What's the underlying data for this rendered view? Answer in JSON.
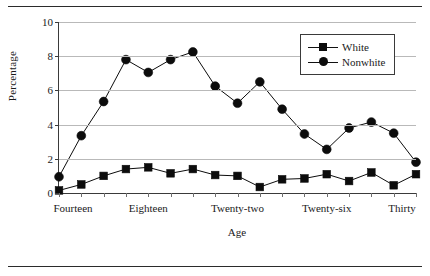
{
  "chart_data": {
    "type": "line",
    "title": "",
    "xlabel": "Age",
    "ylabel": "Percentage",
    "ylim": [
      0,
      10
    ],
    "yticks": [
      0,
      2,
      4,
      6,
      8,
      10
    ],
    "ytick_labels": [
      "0",
      "2",
      "4",
      "6",
      "8",
      "10"
    ],
    "grid": "horizontal",
    "legend_position": "top-right",
    "x": [
      14,
      15,
      16,
      17,
      18,
      19,
      20,
      21,
      22,
      23,
      24,
      25,
      26,
      27,
      28,
      29,
      30
    ],
    "categories": [
      "Fourteen",
      "Fifteen",
      "Sixteen",
      "Seventeen",
      "Eighteen",
      "Nineteen",
      "Twenty",
      "Twenty-one",
      "Twenty-two",
      "Twenty-three",
      "Twenty-four",
      "Twenty-five",
      "Twenty-six",
      "Twenty-seven",
      "Twenty-eight",
      "Twenty-nine",
      "Thirty"
    ],
    "xtick_labels": [
      "Fourteen",
      "Eighteen",
      "Twenty-two",
      "Twenty-six",
      "Thirty"
    ],
    "xtick_values": [
      14,
      18,
      22,
      26,
      30
    ],
    "series": [
      {
        "name": "White",
        "marker": "square",
        "color": "#0c0c0c",
        "values": [
          0.15,
          0.5,
          1.0,
          1.4,
          1.5,
          1.15,
          1.4,
          1.05,
          1.0,
          0.35,
          0.8,
          0.85,
          1.1,
          0.7,
          1.2,
          0.45,
          1.1
        ]
      },
      {
        "name": "Nonwhite",
        "marker": "circle",
        "color": "#0c0c0c",
        "values": [
          0.95,
          3.35,
          5.35,
          7.8,
          7.05,
          7.8,
          8.25,
          6.25,
          5.25,
          6.5,
          4.9,
          3.45,
          2.55,
          3.8,
          4.15,
          3.5,
          1.8
        ]
      }
    ]
  },
  "legend": {
    "items": [
      {
        "label": "White",
        "marker": "square"
      },
      {
        "label": "Nonwhite",
        "marker": "circle"
      }
    ]
  }
}
